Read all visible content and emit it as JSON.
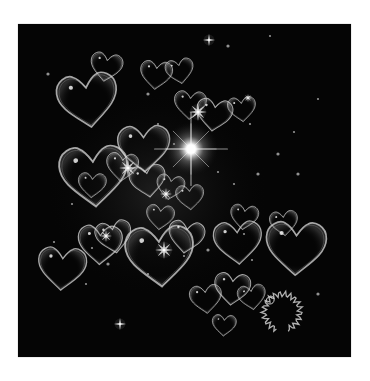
{
  "image": {
    "description": "Dark square artwork of translucent heart-shaped bubbles, sparkles and a bright lens flare",
    "background": "#050505",
    "frame": {
      "x": 18,
      "y": 24,
      "width": 333,
      "height": 333
    },
    "outline_color": "#d8d8d8"
  },
  "flare": {
    "cx": 173,
    "cy": 125,
    "r": 28,
    "color": "#ffffff"
  },
  "hearts": [
    {
      "x": 40,
      "y": 48,
      "s": 30,
      "rot": -8
    },
    {
      "x": 72,
      "y": 28,
      "s": 16,
      "rot": 10
    },
    {
      "x": 42,
      "y": 120,
      "s": 34,
      "rot": -4
    },
    {
      "x": 122,
      "y": 36,
      "s": 16,
      "rot": 6
    },
    {
      "x": 148,
      "y": 34,
      "s": 14,
      "rot": -10
    },
    {
      "x": 156,
      "y": 66,
      "s": 16,
      "rot": 4
    },
    {
      "x": 178,
      "y": 74,
      "s": 18,
      "rot": 8
    },
    {
      "x": 210,
      "y": 72,
      "s": 14,
      "rot": -6
    },
    {
      "x": 100,
      "y": 100,
      "s": 26,
      "rot": -2
    },
    {
      "x": 88,
      "y": 128,
      "s": 16,
      "rot": 6
    },
    {
      "x": 112,
      "y": 140,
      "s": 18,
      "rot": -8
    },
    {
      "x": 60,
      "y": 148,
      "s": 14,
      "rot": 4
    },
    {
      "x": 138,
      "y": 150,
      "s": 14,
      "rot": 10
    },
    {
      "x": 158,
      "y": 160,
      "s": 14,
      "rot": -4
    },
    {
      "x": 128,
      "y": 180,
      "s": 14,
      "rot": 6
    },
    {
      "x": 108,
      "y": 200,
      "s": 34,
      "rot": -4
    },
    {
      "x": 150,
      "y": 196,
      "s": 18,
      "rot": 8
    },
    {
      "x": 60,
      "y": 200,
      "s": 22,
      "rot": 2
    },
    {
      "x": 78,
      "y": 196,
      "s": 18,
      "rot": -10
    },
    {
      "x": 20,
      "y": 222,
      "s": 24,
      "rot": 4
    },
    {
      "x": 196,
      "y": 196,
      "s": 24,
      "rot": -4
    },
    {
      "x": 212,
      "y": 180,
      "s": 14,
      "rot": 8
    },
    {
      "x": 252,
      "y": 186,
      "s": 14,
      "rot": -6
    },
    {
      "x": 248,
      "y": 196,
      "s": 30,
      "rot": 2
    },
    {
      "x": 172,
      "y": 260,
      "s": 16,
      "rot": -6
    },
    {
      "x": 196,
      "y": 248,
      "s": 18,
      "rot": 6
    },
    {
      "x": 220,
      "y": 260,
      "s": 14,
      "rot": -8
    },
    {
      "x": 194,
      "y": 290,
      "s": 12,
      "rot": 4
    }
  ],
  "sparkles": [
    {
      "x": 191,
      "y": 16,
      "r": 6,
      "points": 4
    },
    {
      "x": 102,
      "y": 300,
      "r": 6,
      "points": 4
    },
    {
      "x": 180,
      "y": 88,
      "r": 9,
      "points": 8
    },
    {
      "x": 110,
      "y": 144,
      "r": 9,
      "points": 8
    },
    {
      "x": 148,
      "y": 170,
      "r": 6,
      "points": 8
    },
    {
      "x": 88,
      "y": 212,
      "r": 6,
      "points": 8
    },
    {
      "x": 146,
      "y": 226,
      "r": 9,
      "points": 8
    },
    {
      "x": 230,
      "y": 74,
      "r": 4,
      "points": 8
    }
  ],
  "dots": [
    [
      210,
      22
    ],
    [
      252,
      12
    ],
    [
      232,
      100
    ],
    [
      260,
      130
    ],
    [
      300,
      75
    ],
    [
      276,
      108
    ],
    [
      280,
      150
    ],
    [
      200,
      148
    ],
    [
      216,
      160
    ],
    [
      240,
      150
    ],
    [
      226,
      210
    ],
    [
      234,
      236
    ],
    [
      300,
      270
    ],
    [
      74,
      224
    ],
    [
      54,
      180
    ],
    [
      90,
      240
    ],
    [
      130,
      250
    ],
    [
      166,
      232
    ],
    [
      190,
      226
    ],
    [
      140,
      100
    ],
    [
      156,
      120
    ],
    [
      130,
      70
    ],
    [
      36,
      218
    ],
    [
      68,
      260
    ],
    [
      30,
      50
    ]
  ],
  "signature": {
    "cx": 264,
    "cy": 288,
    "r": 18
  }
}
